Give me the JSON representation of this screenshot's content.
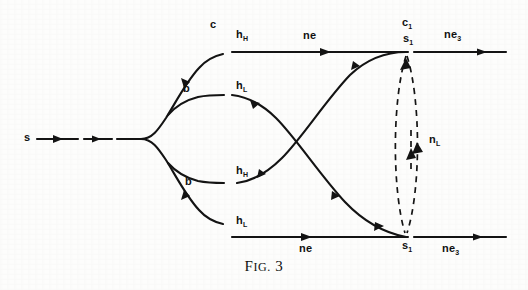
{
  "figure": {
    "caption_prefix": "F",
    "caption_small": "IG.",
    "caption_number": "3",
    "caption_full": "FIG. 3",
    "ink_color": "#131313",
    "paper_color": "#fdfdfc"
  },
  "labels": {
    "source": "s",
    "branch_upper": "b",
    "branch_lower": "b",
    "c_top": "c",
    "c_right": "c",
    "c_right_sub": "1",
    "h_top": "h",
    "h_top_sub": "H",
    "h_upper_mid": "h",
    "h_upper_mid_sub": "L",
    "h_lower_mid": "h",
    "h_lower_mid_sub": "H",
    "h_bottom": "h",
    "h_bottom_sub": "L",
    "ne_top": "ne",
    "ne_bottom": "ne",
    "ne_top_right": "ne",
    "ne_top_right_sub": "3",
    "ne_bottom_right": "ne",
    "ne_bottom_right_sub": "3",
    "s_top_right": "s",
    "s_top_right_sub": "1",
    "s_bottom_right": "s",
    "s_bottom_right_sub": "1",
    "n_vertical": "n",
    "n_vertical_sub": "L"
  }
}
